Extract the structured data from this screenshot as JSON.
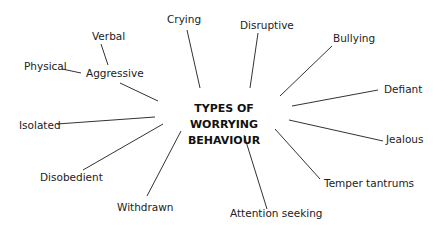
{
  "diagram": {
    "type": "mind-map",
    "center": {
      "line1": "TYPES OF WORRYING",
      "line2": "BEHAVIOUR"
    },
    "branches": [
      {
        "id": "crying",
        "label": "Crying"
      },
      {
        "id": "disruptive",
        "label": "Disruptive"
      },
      {
        "id": "bullying",
        "label": "Bullying"
      },
      {
        "id": "defiant",
        "label": "Defiant"
      },
      {
        "id": "jealous",
        "label": "Jealous"
      },
      {
        "id": "temper-tantrums",
        "label": "Temper tantrums"
      },
      {
        "id": "attention-seeking",
        "label": "Attention seeking"
      },
      {
        "id": "withdrawn",
        "label": "Withdrawn"
      },
      {
        "id": "disobedient",
        "label": "Disobedient"
      },
      {
        "id": "isolated",
        "label": "Isolated"
      },
      {
        "id": "aggressive",
        "label": "Aggressive",
        "children": [
          {
            "id": "physical",
            "label": "Physical"
          },
          {
            "id": "verbal",
            "label": "Verbal"
          }
        ]
      }
    ],
    "line_color": "#333333",
    "text_color": "#222222"
  }
}
